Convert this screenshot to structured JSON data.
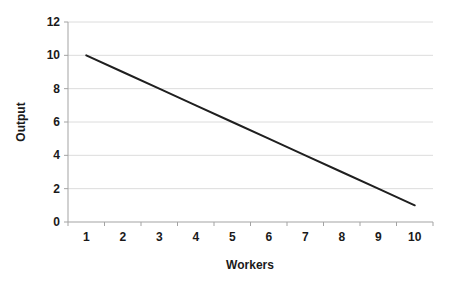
{
  "chart_data": {
    "type": "line",
    "title": "",
    "xlabel": "Workers",
    "ylabel": "Output",
    "x": [
      1,
      2,
      3,
      4,
      5,
      6,
      7,
      8,
      9,
      10
    ],
    "x_tick_labels": [
      "1",
      "2",
      "3",
      "4",
      "5",
      "6",
      "7",
      "8",
      "9",
      "10"
    ],
    "series": [
      {
        "name": "Output",
        "values": [
          10,
          9,
          8,
          7,
          6,
          5,
          4,
          3,
          2,
          1
        ]
      }
    ],
    "ylim": [
      0,
      12
    ],
    "y_ticks": [
      0,
      2,
      4,
      6,
      8,
      10,
      12
    ],
    "grid": "horizontal",
    "legend_position": "none",
    "colors": {
      "line": "#1f1f1f",
      "axis": "#a3a3a3",
      "gridline": "#dcdcdc",
      "text": "#1a1a1a",
      "background": "#ffffff"
    }
  }
}
